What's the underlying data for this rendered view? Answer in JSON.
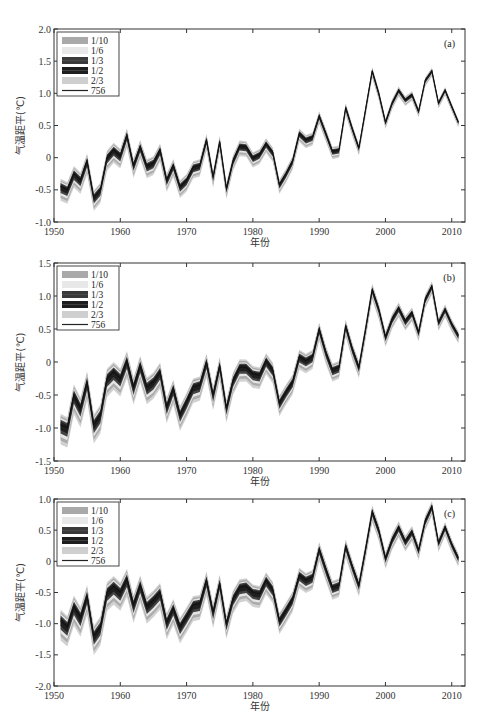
{
  "figure": {
    "ylabel": "气温距平(℃)",
    "xlabel": "年份",
    "legend": [
      {
        "label": "1/10",
        "color": "#a9a9a9",
        "type": "band"
      },
      {
        "label": "1/6",
        "color": "#e8e8e8",
        "type": "band"
      },
      {
        "label": "1/3",
        "color": "#3a3a3a",
        "type": "band"
      },
      {
        "label": "1/2",
        "color": "#1e1e1e",
        "type": "band"
      },
      {
        "label": "2/3",
        "color": "#cfcfcf",
        "type": "band"
      },
      {
        "label": "756",
        "color": "#222222",
        "type": "line"
      }
    ]
  },
  "chart_data": [
    {
      "type": "line",
      "panel": "(a)",
      "title": "",
      "xlabel": "年份",
      "ylabel": "气温距平(℃)",
      "xlim": [
        1950,
        2012
      ],
      "ylim": [
        -1.0,
        2.0
      ],
      "xticks": [
        1950,
        1960,
        1970,
        1980,
        1990,
        2000,
        2010
      ],
      "yticks": [
        -1.0,
        -0.5,
        0,
        0.5,
        1.0,
        1.5,
        2.0
      ],
      "ytick_labels": [
        "-1.0",
        "-0.5",
        "0",
        "0.5",
        "1.0",
        "1.5",
        "2.0"
      ],
      "grid": false,
      "legend_position": "upper left",
      "x": [
        1951,
        1952,
        1953,
        1954,
        1955,
        1956,
        1957,
        1958,
        1959,
        1960,
        1961,
        1962,
        1963,
        1964,
        1965,
        1966,
        1967,
        1968,
        1969,
        1970,
        1971,
        1972,
        1973,
        1974,
        1975,
        1976,
        1977,
        1978,
        1979,
        1980,
        1981,
        1982,
        1983,
        1984,
        1985,
        1986,
        1987,
        1988,
        1989,
        1990,
        1991,
        1992,
        1993,
        1994,
        1995,
        1996,
        1997,
        1998,
        1999,
        2000,
        2001,
        2002,
        2003,
        2004,
        2005,
        2006,
        2007,
        2008,
        2009,
        2010,
        2011
      ],
      "series": [
        {
          "name": "756",
          "values": [
            -0.45,
            -0.5,
            -0.25,
            -0.35,
            -0.05,
            -0.62,
            -0.5,
            0.0,
            0.12,
            0.03,
            0.35,
            -0.12,
            0.17,
            -0.13,
            -0.08,
            0.12,
            -0.35,
            -0.12,
            -0.45,
            -0.35,
            -0.15,
            -0.12,
            0.28,
            -0.3,
            0.25,
            -0.48,
            -0.05,
            0.18,
            0.17,
            0.0,
            0.05,
            0.22,
            0.08,
            -0.42,
            -0.25,
            -0.05,
            0.38,
            0.28,
            0.32,
            0.65,
            0.38,
            0.1,
            0.12,
            0.78,
            0.45,
            0.15,
            0.75,
            1.35,
            1.0,
            0.55,
            0.85,
            1.05,
            0.9,
            0.98,
            0.72,
            1.2,
            1.35,
            0.85,
            1.05,
            0.8,
            0.55
          ]
        }
      ],
      "band_spread_early": 0.22,
      "band_spread_late": 0.08
    },
    {
      "type": "line",
      "panel": "(b)",
      "title": "",
      "xlabel": "年份",
      "ylabel": "气温距平(℃)",
      "xlim": [
        1950,
        2012
      ],
      "ylim": [
        -1.5,
        1.5
      ],
      "xticks": [
        1950,
        1960,
        1970,
        1980,
        1990,
        2000,
        2010
      ],
      "yticks": [
        -1.5,
        -1.0,
        -0.5,
        0,
        0.5,
        1.0,
        1.5
      ],
      "ytick_labels": [
        "-1.5",
        "-1.0",
        "-0.5",
        "0",
        "0.5",
        "1.0",
        "1.5"
      ],
      "grid": false,
      "legend_position": "upper left",
      "x": [
        1951,
        1952,
        1953,
        1954,
        1955,
        1956,
        1957,
        1958,
        1959,
        1960,
        1961,
        1962,
        1963,
        1964,
        1965,
        1966,
        1967,
        1968,
        1969,
        1970,
        1971,
        1972,
        1973,
        1974,
        1975,
        1976,
        1977,
        1978,
        1979,
        1980,
        1981,
        1982,
        1983,
        1984,
        1985,
        1986,
        1987,
        1988,
        1989,
        1990,
        1991,
        1992,
        1993,
        1994,
        1995,
        1996,
        1997,
        1998,
        1999,
        2000,
        2001,
        2002,
        2003,
        2004,
        2005,
        2006,
        2007,
        2008,
        2009,
        2010,
        2011
      ],
      "series": [
        {
          "name": "756",
          "values": [
            -0.95,
            -1.0,
            -0.5,
            -0.7,
            -0.3,
            -0.95,
            -0.8,
            -0.25,
            -0.15,
            -0.25,
            0.02,
            -0.38,
            -0.05,
            -0.38,
            -0.3,
            -0.15,
            -0.68,
            -0.4,
            -0.8,
            -0.6,
            -0.38,
            -0.35,
            0.0,
            -0.5,
            -0.05,
            -0.7,
            -0.28,
            -0.08,
            -0.08,
            -0.18,
            -0.2,
            0.02,
            -0.12,
            -0.62,
            -0.45,
            -0.3,
            0.08,
            0.02,
            0.08,
            0.5,
            0.15,
            -0.12,
            -0.08,
            0.55,
            0.2,
            -0.08,
            0.5,
            1.1,
            0.8,
            0.38,
            0.65,
            0.82,
            0.62,
            0.75,
            0.45,
            0.95,
            1.15,
            0.6,
            0.8,
            0.58,
            0.4
          ]
        }
      ],
      "band_spread_early": 0.3,
      "band_spread_late": 0.12
    },
    {
      "type": "line",
      "panel": "(c)",
      "title": "",
      "xlabel": "年份",
      "ylabel": "气温距平(℃)",
      "xlim": [
        1950,
        2012
      ],
      "ylim": [
        -2.0,
        1.0
      ],
      "xticks": [
        1950,
        1960,
        1970,
        1980,
        1990,
        2000,
        2010
      ],
      "yticks": [
        -2.0,
        -1.5,
        -1.0,
        -0.5,
        0,
        0.5,
        1.0
      ],
      "ytick_labels": [
        "-2.0",
        "-1.5",
        "-1.0",
        "-0.5",
        "0",
        "0.5",
        "1.0"
      ],
      "grid": false,
      "legend_position": "upper left",
      "x": [
        1951,
        1952,
        1953,
        1954,
        1955,
        1956,
        1957,
        1958,
        1959,
        1960,
        1961,
        1962,
        1963,
        1964,
        1965,
        1966,
        1967,
        1968,
        1969,
        1970,
        1971,
        1972,
        1973,
        1974,
        1975,
        1976,
        1977,
        1978,
        1979,
        1980,
        1981,
        1982,
        1983,
        1984,
        1985,
        1986,
        1987,
        1988,
        1989,
        1990,
        1991,
        1992,
        1993,
        1994,
        1995,
        1996,
        1997,
        1998,
        1999,
        2000,
        2001,
        2002,
        2003,
        2004,
        2005,
        2006,
        2007,
        2008,
        2009,
        2010,
        2011
      ],
      "series": [
        {
          "name": "756",
          "values": [
            -0.95,
            -1.05,
            -0.72,
            -0.9,
            -0.55,
            -1.2,
            -1.05,
            -0.5,
            -0.4,
            -0.5,
            -0.28,
            -0.7,
            -0.38,
            -0.72,
            -0.62,
            -0.5,
            -0.98,
            -0.75,
            -1.05,
            -0.88,
            -0.7,
            -0.68,
            -0.3,
            -0.82,
            -0.35,
            -1.0,
            -0.6,
            -0.42,
            -0.4,
            -0.5,
            -0.52,
            -0.3,
            -0.45,
            -0.95,
            -0.78,
            -0.6,
            -0.22,
            -0.3,
            -0.25,
            0.2,
            -0.12,
            -0.42,
            -0.38,
            0.25,
            -0.08,
            -0.38,
            0.2,
            0.8,
            0.5,
            0.05,
            0.35,
            0.55,
            0.32,
            0.48,
            0.18,
            0.65,
            0.88,
            0.3,
            0.55,
            0.28,
            0.05
          ]
        }
      ],
      "band_spread_early": 0.32,
      "band_spread_late": 0.14
    }
  ],
  "layout": {
    "panels": [
      {
        "left": 54,
        "right": 465,
        "top": 29,
        "bottom": 222
      },
      {
        "left": 54,
        "right": 465,
        "top": 263,
        "bottom": 461
      },
      {
        "left": 54,
        "right": 465,
        "top": 499,
        "bottom": 686
      }
    ]
  }
}
